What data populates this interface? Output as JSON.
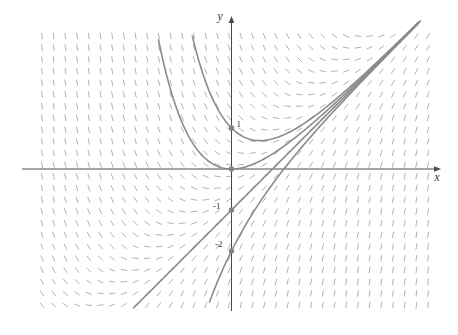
{
  "figure": {
    "kind": "direction-field-plot",
    "background": "#ffffff"
  },
  "chart_data": {
    "type": "slope_field",
    "ode": "y' = x - y",
    "slope_fn": "x - y",
    "general_solution": "y = x - 1 + C*exp(-x)",
    "asymptote": "y = x - 1",
    "axis_labels": {
      "x": "x",
      "y": "y"
    },
    "tick_labels": [
      {
        "text": "1",
        "px": 236.5,
        "py": 126.5
      },
      {
        "text": "-1",
        "px": 213,
        "py": 208.5
      },
      {
        "text": "-2",
        "px": 215,
        "py": 247
      }
    ],
    "marked_points": [
      [
        0,
        1
      ],
      [
        0,
        0
      ],
      [
        0,
        -1
      ],
      [
        0,
        -2
      ]
    ],
    "series": [
      {
        "name": "C = 2",
        "C": 2,
        "initial_point": [
          0,
          1
        ],
        "x_start": -0.955,
        "x_end": 4.58
      },
      {
        "name": "C = 1",
        "C": 1,
        "initial_point": [
          0,
          0
        ],
        "x_start": -1.78,
        "x_end": 4.58
      },
      {
        "name": "C = 0 (line y = x - 1)",
        "C": 0,
        "initial_point": [
          0,
          -1
        ],
        "x_start": -2.39,
        "x_end": 4.61
      },
      {
        "name": "C = -1",
        "C": -1,
        "initial_point": [
          0,
          -2
        ],
        "x_start": -0.535,
        "x_end": 4.58
      }
    ],
    "x_range": [
      -4.65,
      4.85
    ],
    "y_range": [
      -3.3,
      3.3
    ],
    "grid": "slope marks on regular grid",
    "legend": "none",
    "layout": {
      "width": 458,
      "height": 335,
      "origin_px": [
        231.5,
        169
      ],
      "unit_px": 41,
      "grid_start_px": [
        42,
        36
      ],
      "grid_step_px": 11.7,
      "grid_cols": 34,
      "grid_rows": 24,
      "mark_len_px": 6.5,
      "curve_width_px": 1.6,
      "dot_radius_px": 2.7,
      "x_axis_px": {
        "x1": 22,
        "x2": 434,
        "y": 169,
        "tip": 441
      },
      "y_axis_px": {
        "y1": 23,
        "y2": 311,
        "x": 231.5,
        "tip": 16
      },
      "x_label_pos": [
        434.5,
        181
      ],
      "y_label_pos": [
        217.5,
        20
      ]
    },
    "colors": {
      "field_mark": "#b1b1b1",
      "curve": "#8b8b8b",
      "dot": "#848484",
      "axis": "#4a4a4a",
      "label": "#333333",
      "background": "#ffffff"
    }
  }
}
